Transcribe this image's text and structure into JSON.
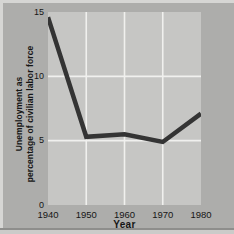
{
  "colors": {
    "outer_bg": "#adadab",
    "plot_bg": "#c6c6c4",
    "gridline": "#f0f0ee",
    "line": "#343434",
    "text": "#161616",
    "edge_light": "#d6d6d4",
    "edge_dark": "#8e8e8c",
    "edge_bottom_light": "#cbcbc9"
  },
  "chart_data": {
    "type": "line",
    "categories": [
      "1940",
      "1950",
      "1960",
      "1970",
      "1980"
    ],
    "values": [
      14.6,
      5.3,
      5.5,
      4.9,
      7.1
    ],
    "series_name": "Unemployment as percentage of civilian labor force",
    "title": "",
    "xlabel": "Year",
    "ylabel": "Unemployment as percentage of civilian labor force",
    "ylabel_lines": [
      "Unemployment as",
      "percentage of civilian labor force"
    ],
    "ylim": [
      0,
      15
    ],
    "y_ticks": [
      0,
      5,
      10,
      15
    ],
    "grid": true,
    "legend": false
  }
}
